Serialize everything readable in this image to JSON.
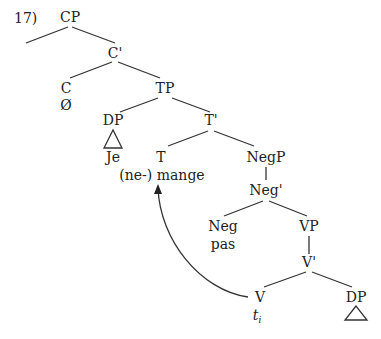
{
  "example_number": "17)",
  "nodes": {
    "cp": "CP",
    "c_bar": "C'",
    "c": "C",
    "c_word": "Ø",
    "tp": "TP",
    "dp_subj": "DP",
    "dp_subj_word": "Je",
    "t_bar": "T'",
    "t": "T",
    "t_word": "(ne-) mange",
    "negp": "NegP",
    "neg_bar": "Neg'",
    "neg": "Neg",
    "neg_word": "pas",
    "vp": "VP",
    "v_bar": "V'",
    "v": "V",
    "v_trace": "t",
    "v_trace_sub": "i",
    "dp_obj": "DP"
  },
  "movement": {
    "from": "V",
    "to": "T",
    "description": "head movement of verb from V to T"
  }
}
